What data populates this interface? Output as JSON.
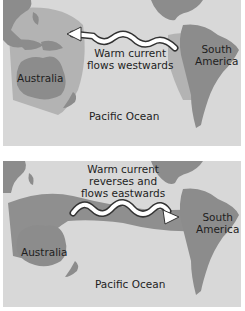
{
  "colors": {
    "ocean": "#d8d8d8",
    "land": "#8c8c8c",
    "warm_water_top": "#b3b3b3",
    "warm_water_bottom": "#8f8f8f",
    "arrow_fill": "#ffffff",
    "arrow_outline": "#333333",
    "text": "#1e1e1e"
  },
  "top_map": {
    "current_label_line1": "Warm current",
    "current_label_line2": "flows westwards",
    "australia": "Australia",
    "south_america_line1": "South",
    "south_america_line2": "America",
    "ocean": "Pacific Ocean",
    "arrow_direction": "west"
  },
  "bottom_map": {
    "current_label_line1": "Warm current",
    "current_label_line2": "reverses and",
    "current_label_line3": "flows eastwards",
    "australia": "Australia",
    "south_america_line1": "South",
    "south_america_line2": "America",
    "ocean": "Pacific Ocean",
    "arrow_direction": "east"
  }
}
